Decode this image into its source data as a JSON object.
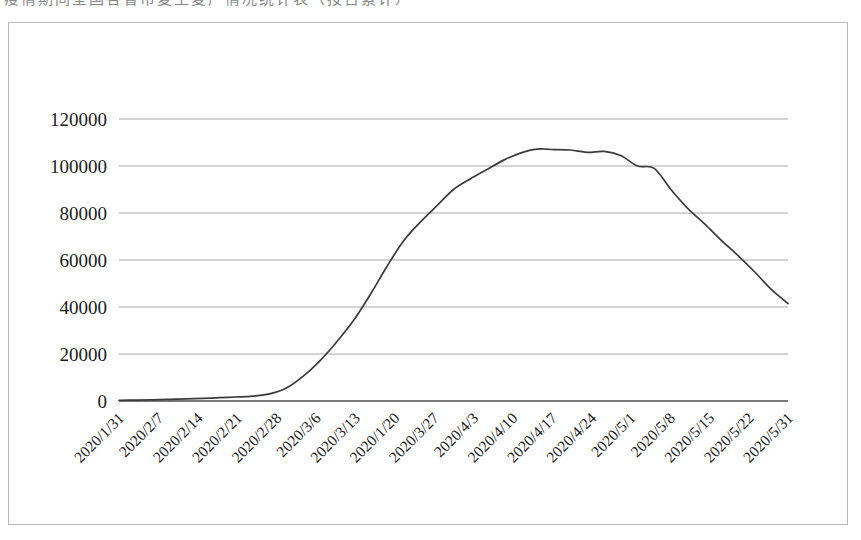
{
  "scan": {
    "top_text_fragment": "疫情期间全国各省市复工复产情况统计表（按日累计）"
  },
  "chart_data": {
    "type": "line",
    "title": "",
    "subtitle": "",
    "xlabel": "",
    "ylabel": "",
    "grid": true,
    "legend": "none",
    "ylim": [
      0,
      120000
    ],
    "y_ticks": [
      0,
      20000,
      40000,
      60000,
      80000,
      100000,
      120000
    ],
    "y_tick_labels": [
      "0",
      "20000",
      "40000",
      "60000",
      "80000",
      "100000",
      "120000"
    ],
    "x_tick_labels": [
      "2020/1/31",
      "2020/2/7",
      "2020/2/14",
      "2020/2/21",
      "2020/2/28",
      "2020/3/6",
      "2020/3/13",
      "2020/1/20",
      "2020/3/27",
      "2020/4/3",
      "2020/4/10",
      "2020/4/17",
      "2020/4/24",
      "2020/5/1",
      "2020/5/8",
      "2020/5/15",
      "2020/5/22",
      "2020/5/31"
    ],
    "series": [
      {
        "name": "",
        "color": "#3b3b3b",
        "x": [
          "2020/1/31",
          "2020/2/3",
          "2020/2/6",
          "2020/2/9",
          "2020/2/12",
          "2020/2/15",
          "2020/2/18",
          "2020/2/21",
          "2020/2/24",
          "2020/2/27",
          "2020/3/1",
          "2020/3/4",
          "2020/3/7",
          "2020/3/10",
          "2020/3/13",
          "2020/3/16",
          "2020/3/19",
          "2020/3/22",
          "2020/3/25",
          "2020/3/28",
          "2020/3/31",
          "2020/4/3",
          "2020/4/6",
          "2020/4/9",
          "2020/4/12",
          "2020/4/15",
          "2020/4/18",
          "2020/4/21",
          "2020/4/24",
          "2020/4/27",
          "2020/4/30",
          "2020/5/3",
          "2020/5/6",
          "2020/5/9",
          "2020/5/12",
          "2020/5/15",
          "2020/5/18",
          "2020/5/21",
          "2020/5/24",
          "2020/5/27",
          "2020/5/31"
        ],
        "values": [
          300,
          400,
          500,
          700,
          900,
          1100,
          1400,
          1700,
          2100,
          3000,
          5500,
          10500,
          17000,
          25000,
          34000,
          45000,
          57000,
          68000,
          76000,
          83000,
          90000,
          94500,
          98500,
          102500,
          105500,
          107200,
          107000,
          106800,
          105800,
          106200,
          104500,
          100000,
          99000,
          90000,
          82000,
          75500,
          68500,
          62000,
          55000,
          47500,
          41500
        ]
      }
    ],
    "annotations": {
      "peak_value": 107200,
      "peak_date": "2020/4/15",
      "final_value": 41500,
      "final_date": "2020/5/31"
    }
  }
}
